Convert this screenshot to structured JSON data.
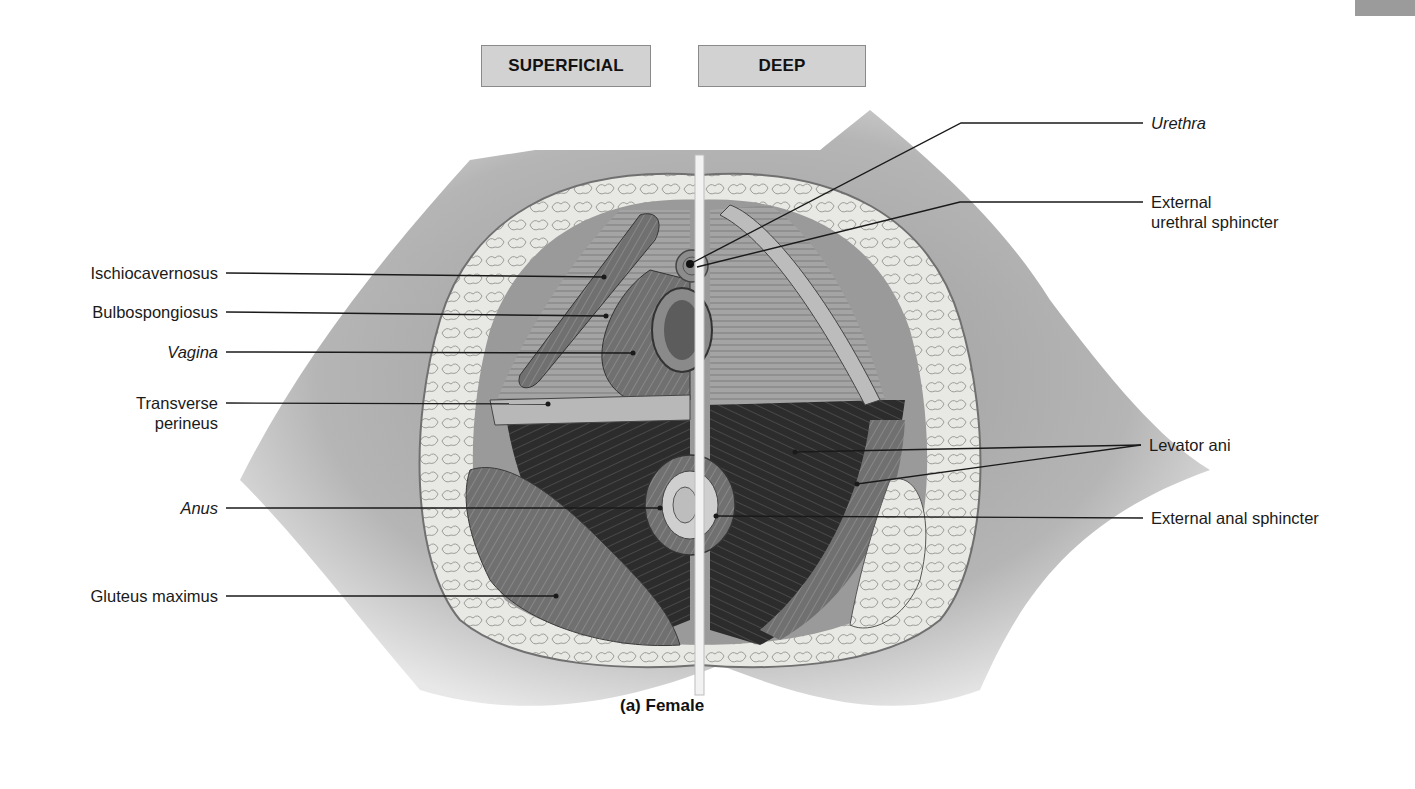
{
  "figure": {
    "caption": "(a) Female",
    "view_tabs": [
      {
        "label": "SUPERFICIAL"
      },
      {
        "label": "DEEP"
      }
    ],
    "colors": {
      "background": "#ffffff",
      "tab_fill": "#d2d2d2",
      "tab_border": "#8a8a8a",
      "skin": "#a8a8a8",
      "fat": "#e6e6e2",
      "muscle_dark": "#2e2e2e",
      "muscle_mid": "#6e6e6e",
      "leader_line": "#1a1a1a"
    }
  },
  "labels": {
    "left": [
      {
        "text": "Ischiocavernosus",
        "italic": false
      },
      {
        "text": "Bulbospongiosus",
        "italic": false
      },
      {
        "text": "Vagina",
        "italic": true
      },
      {
        "text": "Transverse",
        "italic": false,
        "line2": "perineus"
      },
      {
        "text": "Anus",
        "italic": true
      },
      {
        "text": "Gluteus maximus",
        "italic": false
      }
    ],
    "right": [
      {
        "text": "Urethra",
        "italic": true
      },
      {
        "text": "External",
        "italic": false,
        "line2": "urethral sphincter"
      },
      {
        "text": "Levator ani",
        "italic": false
      },
      {
        "text": "External anal sphincter",
        "italic": false
      }
    ]
  }
}
